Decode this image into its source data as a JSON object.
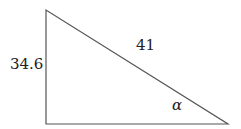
{
  "diagram": {
    "type": "right-triangle",
    "vertices": {
      "top_left": [
        46,
        10
      ],
      "bottom_left": [
        46,
        124
      ],
      "bottom_right": [
        228,
        124
      ]
    },
    "labels": {
      "vertical_side": "34.6",
      "hypotenuse": "41",
      "angle": "α"
    },
    "colors": {
      "stroke": "#555555",
      "text": "#222222",
      "background": "#ffffff"
    }
  }
}
